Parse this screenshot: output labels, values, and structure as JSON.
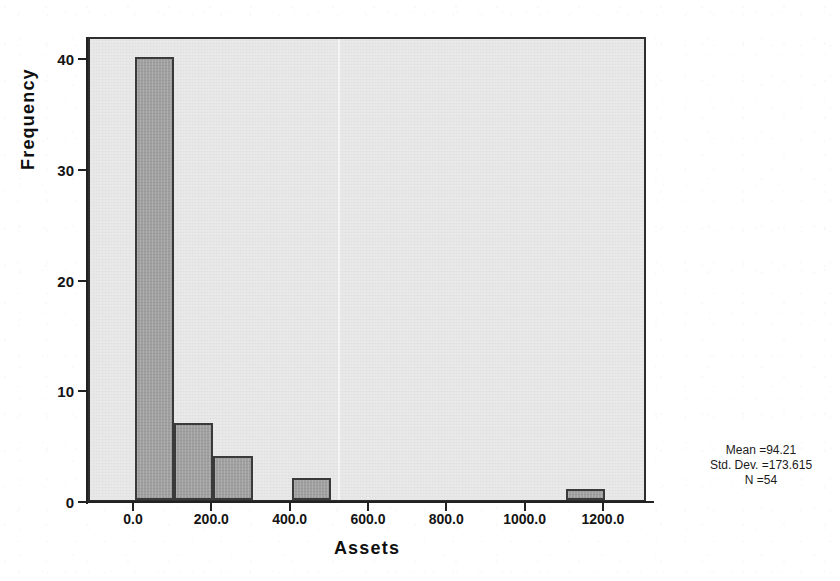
{
  "chart_data": {
    "type": "bar",
    "title": "",
    "subtitle": "",
    "xlabel": "Assets",
    "ylabel": "Frequency",
    "xlim": [
      -115,
      1310
    ],
    "ylim": [
      0,
      42
    ],
    "grid": false,
    "legend": null,
    "bin_width": 100,
    "categories": [
      "0-100",
      "100-200",
      "200-300",
      "300-400",
      "400-500",
      "500-600",
      "600-700",
      "700-800",
      "800-900",
      "900-1000",
      "1000-1100",
      "1100-1200"
    ],
    "bins": [
      {
        "start": 0,
        "end": 100,
        "value": 40
      },
      {
        "start": 100,
        "end": 200,
        "value": 7
      },
      {
        "start": 200,
        "end": 300,
        "value": 4
      },
      {
        "start": 300,
        "end": 400,
        "value": 0
      },
      {
        "start": 400,
        "end": 500,
        "value": 2
      },
      {
        "start": 500,
        "end": 600,
        "value": 0
      },
      {
        "start": 600,
        "end": 700,
        "value": 0
      },
      {
        "start": 700,
        "end": 800,
        "value": 0
      },
      {
        "start": 800,
        "end": 900,
        "value": 0
      },
      {
        "start": 900,
        "end": 1000,
        "value": 0
      },
      {
        "start": 1000,
        "end": 1100,
        "value": 0
      },
      {
        "start": 1100,
        "end": 1200,
        "value": 1
      }
    ],
    "values": [
      40,
      7,
      4,
      0,
      2,
      0,
      0,
      0,
      0,
      0,
      0,
      1
    ],
    "x_ticks": [
      0,
      200,
      400,
      600,
      800,
      1000,
      1200
    ],
    "x_tick_labels": [
      "0.0",
      "200.0",
      "400.0",
      "600.0",
      "800.0",
      "1000.0",
      "1200.0"
    ],
    "y_ticks": [
      0,
      10,
      20,
      30,
      40
    ],
    "y_tick_labels": [
      "0",
      "10",
      "20",
      "30",
      "40"
    ],
    "annotations": {
      "mean_label": "Mean =94.21",
      "std_dev_label": "Std. Dev. =173.615",
      "n_label": "N =54"
    },
    "colors": {
      "bar_fill": "#a0a0a0",
      "bar_outline": "#3a3a3a",
      "plot_background": "#e9e9e9",
      "axis": "#222222",
      "text": "#141414",
      "page_background": "#ffffff"
    }
  },
  "bleed_through": {
    "line_1": "",
    "line_2": ""
  }
}
